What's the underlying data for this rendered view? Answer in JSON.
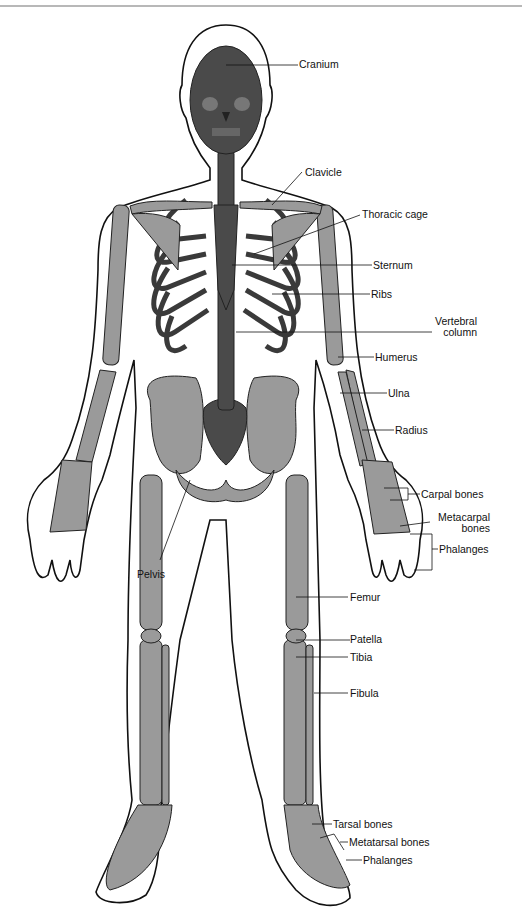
{
  "figure": {
    "colors": {
      "axial_bone": "#4a4a4a",
      "appendicular_bone": "#9a9a9a",
      "body_outline": "#111111",
      "background": "#ffffff",
      "leader_line": "#111111"
    }
  },
  "labels": {
    "cranium": "Cranium",
    "clavicle": "Clavicle",
    "thoracic_cage": "Thoracic cage",
    "sternum": "Sternum",
    "ribs": "Ribs",
    "vertebral_column_1": "Vertebral",
    "vertebral_column_2": "column",
    "humerus": "Humerus",
    "ulna": "Ulna",
    "radius": "Radius",
    "carpal_bones": "Carpal bones",
    "metacarpal_bones_1": "Metacarpal",
    "metacarpal_bones_2": "bones",
    "phalanges_hand": "Phalanges",
    "pelvis": "Pelvis",
    "femur": "Femur",
    "patella": "Patella",
    "tibia": "Tibia",
    "fibula": "Fibula",
    "tarsal_bones": "Tarsal bones",
    "metatarsal_bones": "Metatarsal bones",
    "phalanges_foot": "Phalanges"
  }
}
